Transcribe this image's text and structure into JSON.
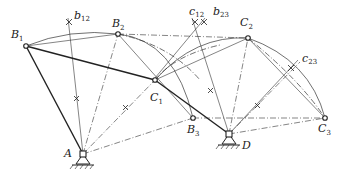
{
  "labels": {
    "B1": {
      "main": "B",
      "sub": "1"
    },
    "B2": {
      "main": "B",
      "sub": "2"
    },
    "B3": {
      "main": "B",
      "sub": "3"
    },
    "C1": {
      "main": "C",
      "sub": "1"
    },
    "C2": {
      "main": "C",
      "sub": "2"
    },
    "C3": {
      "main": "C",
      "sub": "3"
    },
    "A": {
      "main": "A"
    },
    "D": {
      "main": "D"
    },
    "b12": {
      "main": "b",
      "sub": "12"
    },
    "b23": {
      "main": "b",
      "sub": "23"
    },
    "c12": {
      "main": "c",
      "sub": "12"
    },
    "c23": {
      "main": "c",
      "sub": "23"
    }
  },
  "points": {
    "A": [
      83,
      154
    ],
    "D": [
      229,
      134
    ],
    "B1": [
      26,
      46
    ],
    "B2": [
      118,
      34
    ],
    "B3": [
      193,
      118
    ],
    "C1": [
      155,
      80
    ],
    "C2": [
      248,
      38
    ],
    "C3": [
      325,
      118
    ]
  },
  "colors": {
    "line": "#222222",
    "background": "#ffffff"
  }
}
